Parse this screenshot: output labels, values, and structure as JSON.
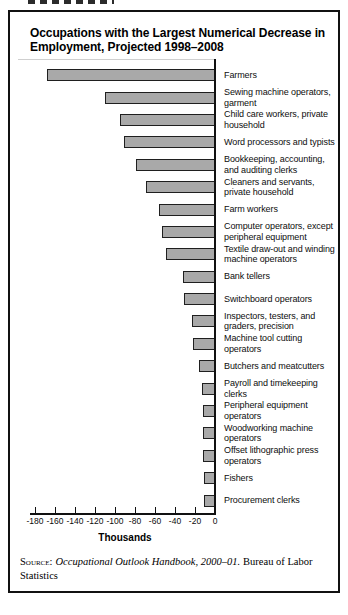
{
  "figure": {
    "title_lines": [
      "Occupations with the Largest Numerical Decrease in",
      "Employment, Projected 1998–2008"
    ]
  },
  "chart_data": {
    "type": "bar",
    "orientation": "horizontal",
    "title": "Occupations with the Largest Numerical Decrease in Employment, Projected 1998–2008",
    "xlabel": "Thousands",
    "xlim": [
      -180,
      0
    ],
    "xticks": [
      -180,
      -160,
      -140,
      -120,
      -100,
      -80,
      -60,
      -40,
      -20,
      0
    ],
    "grid": false,
    "legend": false,
    "categories": [
      "Farmers",
      "Sewing machine operators, garment",
      "Child care workers, private household",
      "Word processors and typists",
      "Bookkeeping, accounting, and auditing clerks",
      "Cleaners and servants, private household",
      "Farm workers",
      "Computer operators, except peripheral equipment",
      "Textile draw-out and winding machine operators",
      "Bank tellers",
      "Switchboard operators",
      "Inspectors, testers, and graders, precision",
      "Machine tool cutting operators",
      "Butchers and meatcutters",
      "Payroll and timekeeping clerks",
      "Peripheral equipment operators",
      "Woodworking machine operators",
      "Offset lithographic press operators",
      "Fishers",
      "Procurement clerks"
    ],
    "values": [
      -168,
      -110,
      -95,
      -91,
      -79,
      -69,
      -56,
      -53,
      -49,
      -32,
      -31,
      -23,
      -22,
      -16,
      -13,
      -12,
      -12,
      -12,
      -11,
      -11
    ]
  },
  "source": {
    "label": "Source:",
    "work": "Occupational Outlook Handbook, 2000–01.",
    "publisher": "Bureau of Labor Statistics"
  },
  "colors": {
    "bar_fill": "#a9a9a9",
    "bar_border": "#1f1f1f",
    "box_border": "#111111",
    "ink": "#111111"
  }
}
